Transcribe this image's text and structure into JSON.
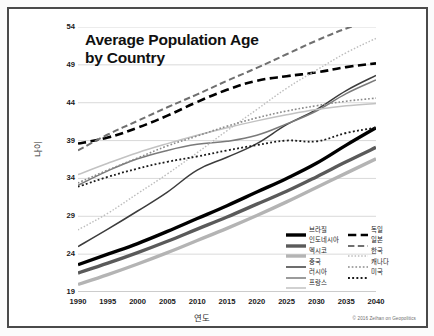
{
  "chart": {
    "title_line1": "Average Population Age",
    "title_line2": "by Country",
    "credit": "© 2016 Zeihan on Geopolitics"
  },
  "axes": {
    "ylabel": "나이",
    "xlabel": "연도",
    "yticks": [
      "54",
      "49",
      "44",
      "39",
      "34",
      "29",
      "24",
      "19"
    ],
    "xticks": [
      "1990",
      "1995",
      "2000",
      "2005",
      "2010",
      "2015",
      "2020",
      "2025",
      "2030",
      "2035",
      "2040"
    ]
  },
  "legend": {
    "left": [
      {
        "label": "브라질",
        "style": "solid",
        "color": "#000000",
        "width": 3.4
      },
      {
        "label": "인도네시아",
        "style": "solid",
        "color": "#5a5a5a",
        "width": 3.4
      },
      {
        "label": "멕시코",
        "style": "solid",
        "color": "#b4b4b4",
        "width": 3.4
      },
      {
        "label": "중국",
        "style": "solid",
        "color": "#3c3c3c",
        "width": 1.5
      },
      {
        "label": "러시아",
        "style": "solid",
        "color": "#7a7a7a",
        "width": 1.5
      },
      {
        "label": "프랑스",
        "style": "solid",
        "color": "#c2c2c2",
        "width": 1.5
      }
    ],
    "right": [
      {
        "label": "독일",
        "style": "dashed",
        "color": "#000000",
        "width": 2.6
      },
      {
        "label": "일본",
        "style": "dashed",
        "color": "#707070",
        "width": 2.0
      },
      {
        "label": "한국",
        "style": "dotted",
        "color": "#bdbdbd",
        "width": 1.4
      },
      {
        "label": "캐나다",
        "style": "dotted",
        "color": "#8a8a8a",
        "width": 1.6
      },
      {
        "label": "미국",
        "style": "dotted",
        "color": "#1a1a1a",
        "width": 1.8
      }
    ]
  },
  "chart_data": {
    "type": "line",
    "title": "Average Population Age by Country",
    "xlabel": "연도",
    "ylabel": "나이",
    "x": [
      1990,
      1995,
      2000,
      2005,
      2010,
      2015,
      2020,
      2025,
      2030,
      2035,
      2040
    ],
    "xlim": [
      1990,
      2040
    ],
    "ylim": [
      19,
      54
    ],
    "yticks": [
      19,
      24,
      29,
      34,
      39,
      44,
      49,
      54
    ],
    "grid": "horizontal",
    "legend_position": "bottom-right",
    "series": [
      {
        "name": "브라질",
        "name_en": "Brazil",
        "style": "solid",
        "color": "#000000",
        "width": 3.4,
        "values": [
          22.6,
          24.0,
          25.4,
          27.0,
          28.7,
          30.4,
          32.2,
          34.0,
          36.0,
          38.4,
          40.7
        ]
      },
      {
        "name": "인도네시아",
        "name_en": "Indonesia",
        "style": "solid",
        "color": "#5a5a5a",
        "width": 3.4,
        "values": [
          21.5,
          22.8,
          24.2,
          25.7,
          27.3,
          28.9,
          30.6,
          32.3,
          34.2,
          36.2,
          38.1
        ]
      },
      {
        "name": "멕시코",
        "name_en": "Mexico",
        "style": "solid",
        "color": "#b4b4b4",
        "width": 3.4,
        "values": [
          20.0,
          21.3,
          22.7,
          24.2,
          25.8,
          27.4,
          29.1,
          30.9,
          32.8,
          34.7,
          36.6
        ]
      },
      {
        "name": "중국",
        "name_en": "China",
        "style": "solid",
        "color": "#3c3c3c",
        "width": 1.5,
        "values": [
          25.0,
          27.3,
          29.7,
          32.2,
          35.1,
          36.8,
          38.6,
          41.1,
          43.1,
          45.6,
          47.6
        ]
      },
      {
        "name": "러시아",
        "name_en": "Russia",
        "style": "solid",
        "color": "#7a7a7a",
        "width": 1.5,
        "values": [
          33.1,
          35.0,
          36.6,
          37.7,
          38.5,
          38.9,
          39.7,
          41.2,
          42.9,
          45.2,
          47.0
        ]
      },
      {
        "name": "프랑스",
        "name_en": "France",
        "style": "solid",
        "color": "#c2c2c2",
        "width": 1.5,
        "values": [
          34.5,
          36.0,
          37.4,
          38.6,
          39.7,
          40.7,
          41.6,
          42.4,
          43.1,
          43.6,
          43.9
        ]
      },
      {
        "name": "독일",
        "name_en": "Germany",
        "style": "dashed",
        "color": "#000000",
        "width": 2.6,
        "values": [
          38.6,
          39.4,
          40.7,
          42.3,
          44.1,
          45.7,
          46.9,
          47.5,
          48.0,
          48.7,
          49.2
        ]
      },
      {
        "name": "일본",
        "name_en": "Japan",
        "style": "dashed",
        "color": "#707070",
        "width": 2.0,
        "values": [
          37.7,
          39.8,
          41.6,
          43.4,
          45.1,
          46.9,
          48.6,
          50.4,
          52.2,
          53.8,
          55.0
        ]
      },
      {
        "name": "한국",
        "name_en": "South Korea",
        "style": "dotted",
        "color": "#bdbdbd",
        "width": 1.4,
        "values": [
          27.2,
          29.4,
          32.0,
          34.6,
          37.4,
          40.3,
          43.1,
          45.9,
          48.3,
          50.6,
          52.5
        ]
      },
      {
        "name": "캐나다",
        "name_en": "Canada",
        "style": "dotted",
        "color": "#8a8a8a",
        "width": 1.6,
        "values": [
          33.4,
          35.1,
          36.7,
          38.3,
          39.6,
          40.9,
          42.0,
          42.9,
          43.6,
          44.2,
          44.6
        ]
      },
      {
        "name": "미국",
        "name_en": "United States",
        "style": "dotted",
        "color": "#1a1a1a",
        "width": 1.8,
        "values": [
          32.9,
          34.2,
          35.3,
          36.2,
          36.9,
          37.7,
          38.4,
          39.0,
          38.9,
          40.0,
          40.7
        ]
      }
    ]
  }
}
